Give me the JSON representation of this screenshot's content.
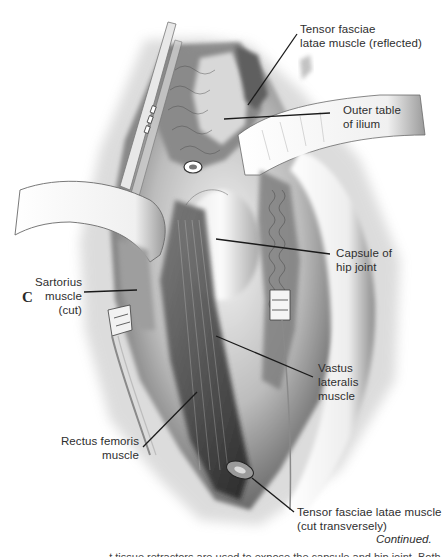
{
  "figure": {
    "panel_letter": "C",
    "continued_label": "Continued.",
    "cutoff_text": "...t tissue retractors are used to expose the capsule and hip joint. Both",
    "labels": {
      "tensor_reflected": {
        "line1": "Tensor fasciae",
        "line2": "latae muscle (reflected)"
      },
      "outer_table": {
        "line1": "Outer table",
        "line2": "of ilium"
      },
      "capsule": {
        "line1": "Capsule of",
        "line2": "hip joint"
      },
      "sartorius": {
        "line1": "Sartorius",
        "line2": "muscle",
        "line3": "(cut)"
      },
      "vastus": {
        "line1": "Vastus",
        "line2": "lateralis",
        "line3": "muscle"
      },
      "rectus": {
        "line1": "Rectus femoris",
        "line2": "muscle"
      },
      "tensor_transverse": {
        "line1": "Tensor fasciae latae muscle",
        "line2": "(cut transversely)"
      }
    }
  }
}
